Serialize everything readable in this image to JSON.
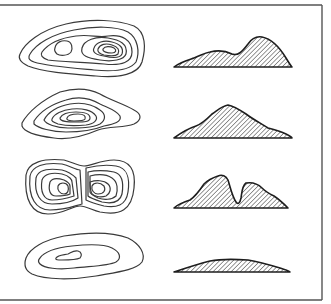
{
  "figure": {
    "colors": {
      "line": "#3a3a3a",
      "profile_outline": "#1e1e1e",
      "hatch": "#444444",
      "frame": "#555555",
      "background": "#ffffff"
    },
    "rows": [
      {
        "id": "row-1",
        "contour_label": "Elongated hill with two summits (higher summit on right)",
        "profile_label": "Profile: low left hump, high right peak"
      },
      {
        "id": "row-2",
        "contour_label": "Single-summit hill, irregular concentric contours",
        "profile_label": "Profile: single symmetric peak"
      },
      {
        "id": "row-3",
        "contour_label": "Two summits separated by a narrow steep gap",
        "profile_label": "Profile: twin peaks with deep notch"
      },
      {
        "id": "row-4",
        "contour_label": "Low broad rise with few contours",
        "profile_label": "Profile: low flat mound"
      }
    ]
  }
}
